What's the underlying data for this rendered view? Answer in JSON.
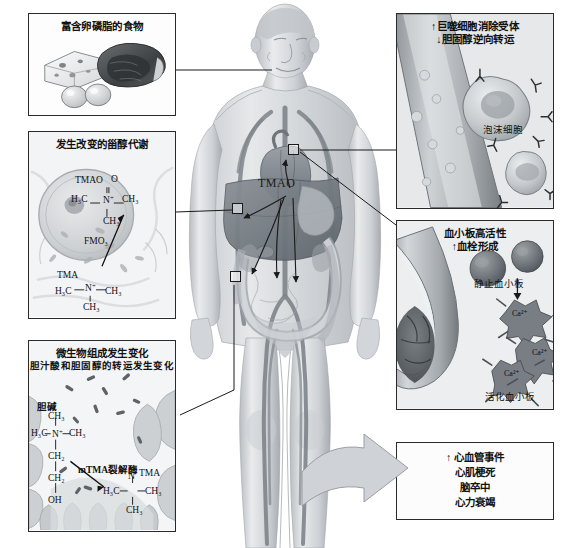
{
  "figure": {
    "kind": "medical-pathway-diagram",
    "center_label": "TMAO",
    "colors": {
      "ink": "#1a1a1a",
      "panel_border": "#2a2a2a",
      "body_tint": "#b9bcc0",
      "organ_dark": "#6e7479",
      "vessel": "#7d848a",
      "arrow_fill": "#cfd2d6",
      "page": "#ffffff"
    }
  },
  "panels": {
    "food": {
      "title": "富含卵磷脂的食物",
      "art_alt": "cheese-wedge-egg-steak-illustration"
    },
    "sterol": {
      "title": "发生改变的甾醇代谢",
      "art_alt": "hepatocyte-liver-cell-micrograph",
      "chem": {
        "tmao_label": "TMAO",
        "tmao_o": "O",
        "tmao_left": "H₃C",
        "tmao_n": "N",
        "tmao_right": "CH₃",
        "tmao_down": "CH₃",
        "enzyme": "FMO₃",
        "tma_label": "TMA",
        "tma_left": "H₃C",
        "tma_n": "N",
        "tma_right": "CH₃",
        "tma_down": "CH₃"
      }
    },
    "microbiome": {
      "title_line1": "微生物组成发生变化",
      "title_line2": "胆汁酸和胆固醇的转运发生变化",
      "art_alt": "gut-lumen-villi-with-bacteria",
      "chem": {
        "choline_label": "胆碱",
        "c1": "CH₃",
        "c_left": "H₃C",
        "c_n": "N",
        "c_right": "CH₃",
        "c2": "CH₂",
        "c3": "CH₂",
        "c4": "OH",
        "enzyme": "mTMA裂解酶",
        "tma_label": "TMA",
        "tma_left": "H₃C",
        "tma_n": "N",
        "tma_right": "CH₃",
        "tma_down": "CH₃"
      }
    },
    "macrophage": {
      "title_line1": "↑巨噬细胞消除受体",
      "title_line2": "↓胆固醇逆向转运",
      "art_alt": "artery-with-foam-cells",
      "callout": "泡沫细胞"
    },
    "platelet": {
      "title_line1": "血小板高活性",
      "title_line2": "↑血栓形成",
      "art_alt": "vessel-with-thrombus-and-platelets",
      "callout_resting": "静止血小板",
      "callout_active": "活化血小板",
      "ion_labels": [
        "Ca²⁺",
        "Ca²⁺",
        "Ca²⁺"
      ]
    },
    "outcome": {
      "lines": [
        "↑ 心血管事件",
        "心肌梗死",
        "脑卒中",
        "心力衰竭"
      ]
    }
  },
  "body": {
    "center_label": "TMAO",
    "connector_count": 3,
    "art_alt": "translucent-obese-male-body-with-organs"
  }
}
